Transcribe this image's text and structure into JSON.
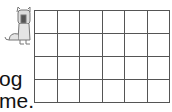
{
  "illustration": {
    "icon": "cartoon-dog-icon",
    "color": "#8a8a8a"
  },
  "text": {
    "line1": "og",
    "line2": "me."
  },
  "grid": {
    "rows": 4,
    "cols": 6,
    "line_color": "#555555"
  }
}
